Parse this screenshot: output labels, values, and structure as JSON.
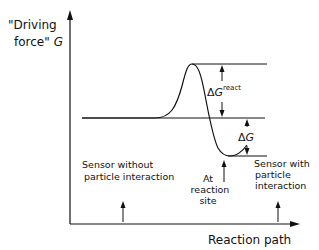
{
  "diagram": {
    "y_axis_label_line1": "\"Driving",
    "y_axis_label_line2": "force\"",
    "y_axis_symbol": "G",
    "x_axis_label": "Reaction path",
    "delta_g_react_prefix": "Δ",
    "delta_g_react_symbol": "G",
    "delta_g_react_superscript": "react",
    "delta_g_prefix": "Δ",
    "delta_g_symbol": "G",
    "left_annotation_line1": "Sensor without",
    "left_annotation_line2": "particle interaction",
    "middle_annotation_line1": "At",
    "middle_annotation_line2": "reaction",
    "middle_annotation_line3": "site",
    "right_annotation_line1": "Sensor with",
    "right_annotation_line2": "particle",
    "right_annotation_line3": "interaction",
    "line_color": "#111111"
  }
}
